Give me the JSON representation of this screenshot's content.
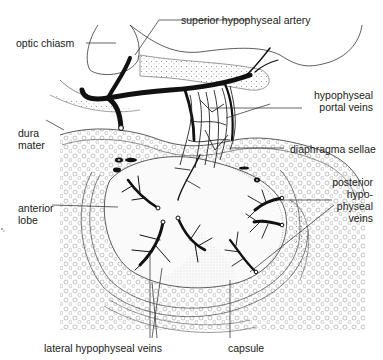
{
  "figure": {
    "labels": {
      "optic_chiasm": "optic chiasm",
      "superior_hypophyseal_artery": "superior hypophyseal artery",
      "hypophyseal_portal_veins": "hypophyseal\nportal veins",
      "dura_mater": "dura\nmater",
      "diaphragma_sellae": "diaphragma sellae",
      "anterior_lobe": "anterior\nlobe",
      "posterior_hypophyseal_veins": "posterior\nhypo-\nphyseal\nveins",
      "lateral_hypophyseal_veins": "lateral hypophyseal veins",
      "capsule": "capsule"
    },
    "colors": {
      "ink": "#1a1a1a",
      "stipple": "#9a9a9a",
      "background": "#ffffff"
    }
  }
}
